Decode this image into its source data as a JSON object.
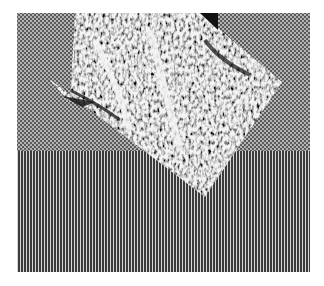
{
  "image": {
    "width": 324,
    "height": 286,
    "background": "#ffffff",
    "description": "Binary halftone test image: grey checkerboard upper field, vertical stripe lower field, rotated diamond of noisy texture overlapping both"
  },
  "regions": {
    "frame": {
      "x": 17,
      "y": 13,
      "w": 293,
      "h": 259
    },
    "upper_field": {
      "pattern": "checkerboard",
      "cell_px": 2,
      "dark": "#5a5a5a",
      "light": "#b4b4b4",
      "y_start": 13,
      "y_end": 151
    },
    "lower_field": {
      "pattern": "vertical-stripes",
      "period_px": 3,
      "dark": "#3c3c3c",
      "light": "#d6d6d6",
      "y_start": 151,
      "y_end": 272
    },
    "diamond": {
      "texture": "random-noise",
      "fg": "#111111",
      "bg": "#f4f4f4",
      "points": [
        [
          75,
          13
        ],
        [
          200,
          13
        ],
        [
          282,
          82
        ],
        [
          205,
          197
        ],
        [
          48,
          78
        ],
        [
          70,
          103
        ]
      ],
      "notch_top_right": [
        [
          200,
          13
        ],
        [
          218,
          13
        ],
        [
          218,
          30
        ]
      ],
      "notch_left_bottom": [
        [
          65,
          100
        ],
        [
          95,
          103
        ],
        [
          80,
          106
        ]
      ]
    }
  }
}
